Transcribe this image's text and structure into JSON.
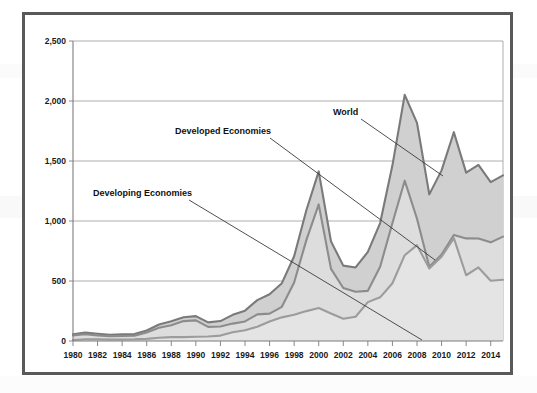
{
  "figure": {
    "border_color": "#58595b",
    "background": "#ffffff"
  },
  "chart_data": {
    "type": "area",
    "stacked": false,
    "title": "",
    "subtitle": "",
    "xlabel": "",
    "ylabel": "",
    "grid": true,
    "legend_position": "inline-annotations",
    "xlim": [
      1980,
      2015
    ],
    "ylim": [
      0,
      2500
    ],
    "y_ticks": [
      0,
      500,
      1000,
      1500,
      2000,
      2500
    ],
    "y_tick_labels": [
      "0",
      "500",
      "1,000",
      "1,500",
      "2,000",
      "2,500"
    ],
    "x_ticks": [
      1980,
      1982,
      1984,
      1986,
      1988,
      1990,
      1992,
      1994,
      1996,
      1998,
      2000,
      2002,
      2004,
      2006,
      2008,
      2010,
      2012,
      2014
    ],
    "x_tick_labels": [
      "1980",
      "1982",
      "1984",
      "1986",
      "1988",
      "1990",
      "1992",
      "1994",
      "1996",
      "1998",
      "2000",
      "2002",
      "2004",
      "2006",
      "2008",
      "2010",
      "2012",
      "2014"
    ],
    "x": [
      1980,
      1981,
      1982,
      1983,
      1984,
      1985,
      1986,
      1987,
      1988,
      1989,
      1990,
      1991,
      1992,
      1993,
      1994,
      1995,
      1996,
      1997,
      1998,
      1999,
      2000,
      2001,
      2002,
      2003,
      2004,
      2005,
      2006,
      2007,
      2008,
      2009,
      2010,
      2011,
      2012,
      2013,
      2014,
      2015
    ],
    "series": [
      {
        "name": "World",
        "color": "#7a7a7a",
        "fill": "#d0d0d0",
        "values": [
          55,
          70,
          60,
          52,
          55,
          58,
          88,
          137,
          164,
          198,
          207,
          155,
          166,
          218,
          253,
          341,
          390,
          482,
          706,
          1092,
          1413,
          830,
          628,
          613,
          742,
          983,
          1464,
          2051,
          1818,
          1222,
          1422,
          1740,
          1403,
          1467,
          1324,
          1380
        ]
      },
      {
        "name": "Developed Economies",
        "color": "#8c8c8c",
        "fill": "#dddddd",
        "values": [
          47,
          56,
          46,
          39,
          42,
          44,
          70,
          110,
          132,
          166,
          172,
          118,
          121,
          145,
          163,
          222,
          228,
          285,
          488,
          843,
          1138,
          601,
          442,
          411,
          418,
          619,
          983,
          1336,
          1019,
          618,
          720,
          883,
          855,
          854,
          822,
          870
        ]
      },
      {
        "name": "Developing Economies",
        "color": "#9c9c9c",
        "fill": "#e4e4e4",
        "values": [
          8,
          14,
          14,
          13,
          13,
          14,
          18,
          27,
          32,
          32,
          35,
          37,
          45,
          73,
          90,
          119,
          162,
          197,
          218,
          249,
          275,
          229,
          186,
          202,
          324,
          364,
          481,
          715,
          799,
          604,
          702,
          857,
          548,
          613,
          502,
          510
        ]
      }
    ],
    "annotations": [
      {
        "id": "world",
        "text": "World",
        "label_x": 308,
        "label_y": 100,
        "anchor": "start",
        "leader_from_x": 336,
        "leader_from_y": 104,
        "leader_to_x": 418,
        "leader_to_y": 161
      },
      {
        "id": "developed-economies",
        "text": "Developed Economies",
        "label_x": 150,
        "label_y": 119,
        "anchor": "start",
        "leader_from_x": 245,
        "leader_from_y": 123,
        "leader_to_x": 410,
        "leader_to_y": 245
      },
      {
        "id": "developing-economies",
        "text": "Developing Economies",
        "label_x": 68,
        "label_y": 181,
        "anchor": "start",
        "leader_from_x": 164,
        "leader_from_y": 185,
        "leader_to_x": 397,
        "leader_to_y": 325
      }
    ]
  }
}
